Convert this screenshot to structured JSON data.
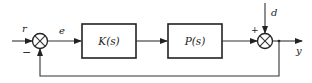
{
  "diagram": {
    "type": "feedback-control-block-diagram",
    "signals": {
      "reference": "r",
      "error": "e",
      "disturbance": "d",
      "output": "y"
    },
    "blocks": {
      "controller": "K(s)",
      "plant": "P(s)"
    },
    "summing_junctions": {
      "input": {
        "plus_sign": "",
        "minus_sign": "−"
      },
      "output": {
        "plus_sign": "+"
      }
    },
    "colors": {
      "line": "#333333",
      "background": "#ffffff"
    }
  }
}
